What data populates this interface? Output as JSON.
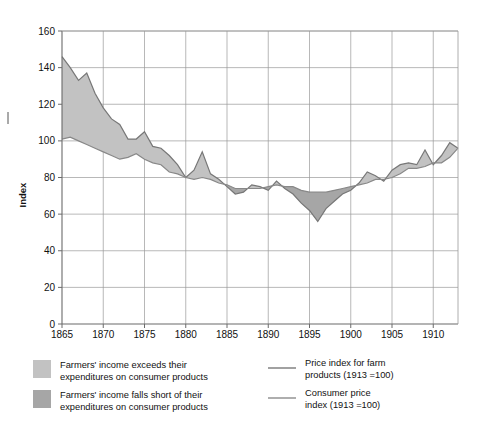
{
  "chart_data": {
    "type": "area",
    "title": "",
    "subtitle": "",
    "xlabel": "",
    "ylabel": "Index",
    "xlim": [
      1865,
      1913
    ],
    "ylim": [
      0,
      160
    ],
    "ytick_values": [
      0,
      20,
      40,
      60,
      80,
      100,
      120,
      140,
      160
    ],
    "ytick_labels": [
      "0",
      "20",
      "40",
      "60",
      "80",
      "100",
      "120",
      "140",
      "160"
    ],
    "xtick_values": [
      1865,
      1870,
      1875,
      1880,
      1885,
      1890,
      1895,
      1900,
      1905,
      1910
    ],
    "xtick_labels": [
      "1865",
      "1870",
      "1875",
      "1880",
      "1885",
      "1890",
      "1895",
      "1900",
      "1905",
      "1910"
    ],
    "grid": true,
    "legend_position": "below",
    "x": [
      1865,
      1866,
      1867,
      1868,
      1869,
      1870,
      1871,
      1872,
      1873,
      1874,
      1875,
      1876,
      1877,
      1878,
      1879,
      1880,
      1881,
      1882,
      1883,
      1884,
      1885,
      1886,
      1887,
      1888,
      1889,
      1890,
      1891,
      1892,
      1893,
      1894,
      1895,
      1896,
      1897,
      1898,
      1899,
      1900,
      1901,
      1902,
      1903,
      1904,
      1905,
      1906,
      1907,
      1908,
      1909,
      1910,
      1911,
      1912,
      1913
    ],
    "series": [
      {
        "name": "Price index for farm products (1913 =100)",
        "color": "#777777",
        "values": [
          146,
          140,
          133,
          137,
          126,
          118,
          112,
          109,
          101,
          101,
          105,
          97,
          96,
          92,
          87,
          80,
          84,
          94,
          82,
          79,
          75,
          71,
          72,
          76,
          75,
          73,
          78,
          74,
          71,
          66,
          62,
          56,
          63,
          67,
          71,
          73,
          77,
          83,
          81,
          78,
          84,
          87,
          88,
          87,
          95,
          87,
          92,
          99,
          96
        ]
      },
      {
        "name": "Consumer price index (1913 =100)",
        "color": "#888888",
        "values": [
          101,
          102,
          100,
          98,
          96,
          94,
          92,
          90,
          91,
          93,
          90,
          88,
          87,
          83,
          82,
          80,
          79,
          80,
          79,
          77,
          76,
          74,
          74,
          74,
          74,
          75,
          76,
          75,
          75,
          73,
          72,
          72,
          72,
          73,
          74,
          75,
          76,
          77,
          79,
          79,
          80,
          82,
          85,
          85,
          86,
          88,
          88,
          91,
          96
        ]
      }
    ],
    "band_fills": {
      "above": {
        "label": "Farmers' income exceeds their expenditures on consumer products",
        "color": "#c2c2c2"
      },
      "below": {
        "label": "Farmers' income falls short of their expenditures on consumer products",
        "color": "#a6a6a6"
      }
    }
  },
  "axis": {
    "ylabel": "Index"
  },
  "legend": {
    "swatch_items": [
      {
        "name": "income-exceeds",
        "color": "#c2c2c2",
        "line1": "Farmers' income exceeds their",
        "line2": "expenditures on consumer products"
      },
      {
        "name": "income-falls-short",
        "color": "#a6a6a6",
        "line1": "Farmers' income falls short of their",
        "line2": "expenditures on consumer products"
      }
    ],
    "line_items": [
      {
        "name": "farm-products-price-index",
        "color": "#8a8a8a",
        "line1": "Price index for farm",
        "line2": "products (1913 =100)"
      },
      {
        "name": "consumer-price-index",
        "color": "#9a9a9a",
        "line1": "Consumer price",
        "line2": "index (1913 =100)"
      }
    ]
  }
}
